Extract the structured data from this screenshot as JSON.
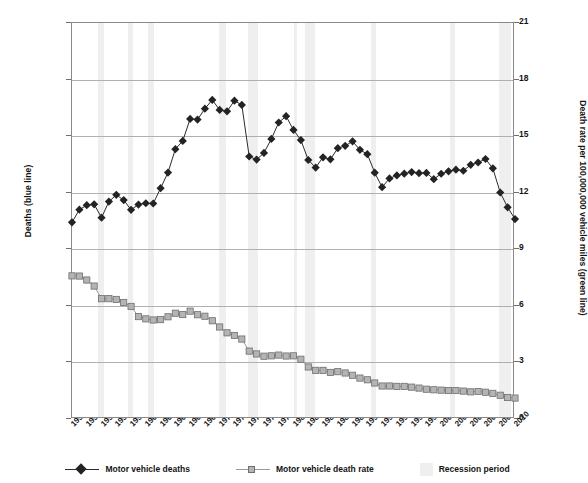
{
  "chart_data": {
    "type": "line",
    "title": "",
    "xlabel": "",
    "ylabel": "Deaths (blue line)",
    "y2label": "Death rate per 100,000,000 vehicle miles (green line)",
    "grid": true,
    "legend_position": "bottom",
    "xlim": [
      1950,
      2010
    ],
    "ylim": [
      0,
      70000
    ],
    "y2lim": [
      0,
      21
    ],
    "yticks": [
      "0",
      "10,000",
      "20,000",
      "30,000",
      "40,000",
      "50,000",
      "60,000",
      "70,000"
    ],
    "ytick_values": [
      0,
      10000,
      20000,
      30000,
      40000,
      50000,
      60000,
      70000
    ],
    "y2ticks": [
      "0",
      "3",
      "6",
      "9",
      "12",
      "15",
      "18",
      "21"
    ],
    "y2tick_values": [
      0,
      3,
      6,
      9,
      12,
      15,
      18,
      21
    ],
    "xticks": [
      "1950",
      "1952",
      "1954",
      "1956",
      "1958",
      "1960",
      "1962",
      "1964",
      "1966",
      "1968",
      "1970",
      "1972",
      "1974",
      "1976",
      "1978",
      "1980",
      "1982",
      "1984",
      "1986",
      "1988",
      "1990",
      "1992",
      "1994",
      "1996",
      "1998",
      "2000",
      "2002",
      "2004",
      "2006",
      "2008",
      "2010"
    ],
    "x": [
      1950,
      1951,
      1952,
      1953,
      1954,
      1955,
      1956,
      1957,
      1958,
      1959,
      1960,
      1961,
      1962,
      1963,
      1964,
      1965,
      1966,
      1967,
      1968,
      1969,
      1970,
      1971,
      1972,
      1973,
      1974,
      1975,
      1976,
      1977,
      1978,
      1979,
      1980,
      1981,
      1982,
      1983,
      1984,
      1985,
      1986,
      1987,
      1988,
      1989,
      1990,
      1991,
      1992,
      1993,
      1994,
      1995,
      1996,
      1997,
      1998,
      1999,
      2000,
      2001,
      2002,
      2003,
      2004,
      2005,
      2006,
      2007,
      2008,
      2009,
      2010
    ],
    "series": [
      {
        "name": "Motor vehicle deaths",
        "axis": "left",
        "color": "#232323",
        "marker": "diamond",
        "values": [
          34763,
          36996,
          37794,
          37955,
          35586,
          38426,
          39628,
          38702,
          36981,
          37910,
          38137,
          38091,
          40804,
          43564,
          47700,
          49163,
          53041,
          52924,
          54862,
          56400,
          54633,
          54381,
          56278,
          55511,
          46402,
          45853,
          47038,
          49510,
          52411,
          53524,
          51091,
          49301,
          45779,
          44452,
          46263,
          45901,
          47865,
          48290,
          49078,
          47575,
          46814,
          43536,
          40982,
          42524,
          43063,
          43363,
          43649,
          43458,
          43501,
          42401,
          43354,
          43788,
          44065,
          43884,
          44933,
          45343,
          45963,
          44310,
          40039,
          37423,
          35332
        ]
      },
      {
        "name": "Motor vehicle death rate",
        "axis": "right",
        "color": "#b4b4b4",
        "marker": "square",
        "values": [
          7.59,
          7.58,
          7.37,
          7.05,
          6.38,
          6.38,
          6.34,
          6.18,
          5.97,
          5.43,
          5.31,
          5.25,
          5.27,
          5.42,
          5.61,
          5.54,
          5.72,
          5.53,
          5.45,
          5.21,
          4.88,
          4.57,
          4.43,
          4.24,
          3.6,
          3.45,
          3.33,
          3.35,
          3.39,
          3.34,
          3.35,
          3.17,
          2.76,
          2.58,
          2.58,
          2.47,
          2.51,
          2.44,
          2.32,
          2.17,
          2.08,
          1.91,
          1.75,
          1.75,
          1.73,
          1.73,
          1.69,
          1.64,
          1.58,
          1.55,
          1.53,
          1.51,
          1.51,
          1.48,
          1.44,
          1.46,
          1.42,
          1.36,
          1.26,
          1.14,
          1.11
        ]
      }
    ],
    "recessions": [
      {
        "start": 1953.5,
        "end": 1954.4
      },
      {
        "start": 1957.6,
        "end": 1958.3
      },
      {
        "start": 1960.3,
        "end": 1961.1
      },
      {
        "start": 1969.9,
        "end": 1970.9
      },
      {
        "start": 1973.9,
        "end": 1975.2
      },
      {
        "start": 1980.0,
        "end": 1980.5
      },
      {
        "start": 1981.5,
        "end": 1982.9
      },
      {
        "start": 1990.5,
        "end": 1991.2
      },
      {
        "start": 2001.2,
        "end": 2001.9
      },
      {
        "start": 2007.9,
        "end": 2009.5
      }
    ]
  },
  "legend": {
    "items": [
      {
        "label": "Motor vehicle deaths",
        "kind": "diamond-line",
        "color": "#232323"
      },
      {
        "label": "Motor vehicle death rate",
        "kind": "square-line",
        "color": "#b4b4b4"
      },
      {
        "label": "Recession period",
        "kind": "swatch",
        "color": "#efefef"
      }
    ]
  },
  "colors": {
    "deaths": "#232323",
    "death_rate": "#b4b4b4",
    "recession_band": "#efefef",
    "gridline": "#b0b0b0",
    "axis": "#8a8a8a",
    "text": "#141414"
  }
}
